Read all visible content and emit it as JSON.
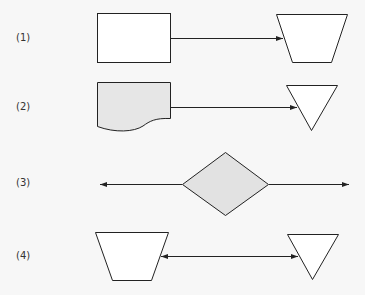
{
  "diagram": {
    "rows": [
      {
        "label": "(1)",
        "left_shape": "process-rectangle",
        "right_shape": "manual-operation-trapezoid",
        "connector": "arrow-right"
      },
      {
        "label": "(2)",
        "left_shape": "document",
        "right_shape": "merge-triangle",
        "connector": "arrow-right"
      },
      {
        "label": "(3)",
        "center_shape": "decision-diamond",
        "connector": "arrows-both-outward"
      },
      {
        "label": "(4)",
        "left_shape": "manual-operation-trapezoid",
        "right_shape": "merge-triangle",
        "connector": "arrow-bidirectional"
      }
    ],
    "colors": {
      "stroke": "#222222",
      "white_fill": "#ffffff",
      "grey_fill": "#e2e2e2",
      "background": "#f7f7f7"
    }
  }
}
